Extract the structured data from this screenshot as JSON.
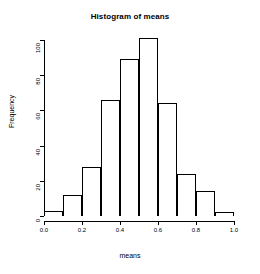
{
  "chart_data": {
    "type": "bar",
    "title": "Histogram of means",
    "xlabel": "means",
    "ylabel": "Frequency",
    "categories": [
      "0.0-0.1",
      "0.1-0.2",
      "0.2-0.3",
      "0.3-0.4",
      "0.4-0.5",
      "0.5-0.6",
      "0.6-0.7",
      "0.7-0.8",
      "0.8-0.9",
      "0.9-1.0"
    ],
    "bin_edges": [
      0.0,
      0.1,
      0.2,
      0.3,
      0.4,
      0.5,
      0.6,
      0.7,
      0.8,
      0.9,
      1.0
    ],
    "values": [
      3,
      12,
      28,
      66,
      89,
      101,
      64,
      24,
      14,
      2
    ],
    "xlim": [
      0.0,
      1.0
    ],
    "ylim": [
      0,
      100
    ],
    "xticks": [
      "0.0",
      "0.2",
      "0.4",
      "0.6",
      "0.8",
      "1.0"
    ],
    "xtick_values": [
      0.0,
      0.2,
      0.4,
      0.6,
      0.8,
      1.0
    ],
    "yticks": [
      "0",
      "20",
      "40",
      "60",
      "80",
      "100"
    ],
    "ytick_values": [
      0,
      20,
      40,
      60,
      80,
      100
    ],
    "grid": false,
    "legend": false,
    "bar_fill_color": "#ffffff",
    "bar_border_color": "#000000",
    "axis_color": "#000000",
    "background_color": "#ffffff"
  }
}
